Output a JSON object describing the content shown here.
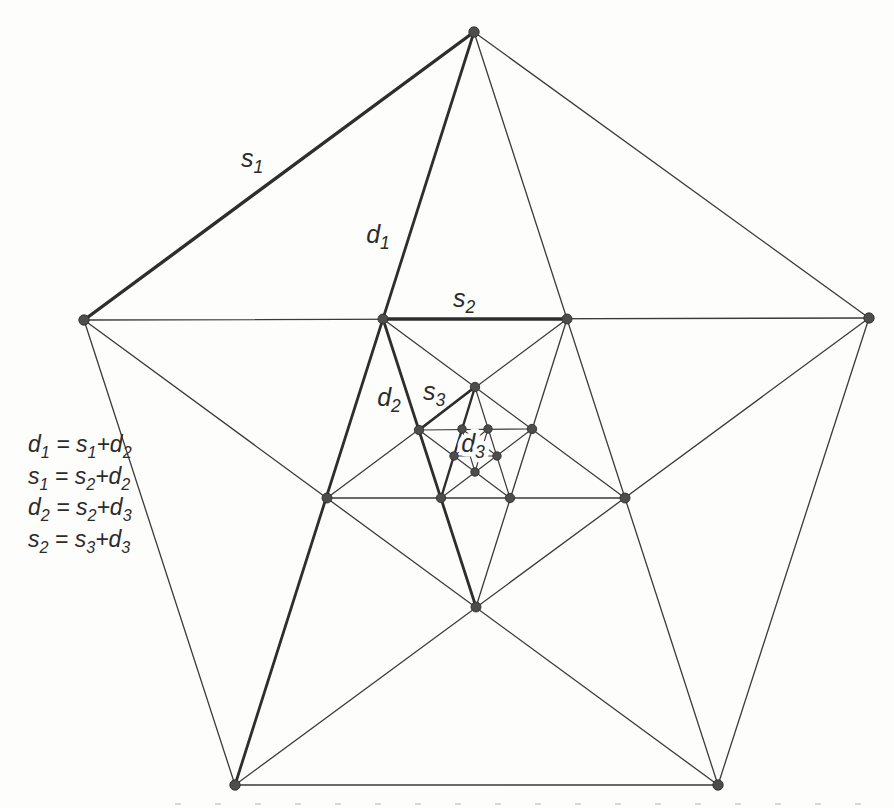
{
  "figure": {
    "width": 894,
    "height": 808,
    "background": "#fdfdfc",
    "line_color": "#3a3a3a",
    "thick_color": "#2e2e2e",
    "dot_fill": "#4d4d4d",
    "dot_ring": "#2f2f2f",
    "text_color": "#2b2b2b"
  },
  "diagram": {
    "label_font_size": 25,
    "lines": [
      {
        "x1": 474,
        "y1": 32,
        "x2": 869,
        "y2": 318,
        "w": 1.3,
        "name": "side-top-right"
      },
      {
        "x1": 869,
        "y1": 318,
        "x2": 718,
        "y2": 785,
        "w": 1.3,
        "name": "side-right-bottomright"
      },
      {
        "x1": 718,
        "y1": 785,
        "x2": 235,
        "y2": 785,
        "w": 1.6,
        "name": "side-bottom"
      },
      {
        "x1": 235,
        "y1": 785,
        "x2": 84,
        "y2": 320,
        "w": 1.3,
        "name": "side-bottomleft-left"
      },
      {
        "x1": 84,
        "y1": 320,
        "x2": 474,
        "y2": 32,
        "w": 3.4,
        "name": "s1",
        "thick": true
      },
      {
        "x1": 474,
        "y1": 32,
        "x2": 235,
        "y2": 785,
        "w": 2.8,
        "name": "d1",
        "thick": true
      },
      {
        "x1": 474,
        "y1": 32,
        "x2": 718,
        "y2": 785,
        "w": 1.3,
        "name": "diagonal-top-bottomright"
      },
      {
        "x1": 84,
        "y1": 320,
        "x2": 869,
        "y2": 318,
        "w": 1.3,
        "name": "diagonal-left-right"
      },
      {
        "x1": 84,
        "y1": 320,
        "x2": 718,
        "y2": 785,
        "w": 1.3,
        "name": "diagonal-left-bottomright"
      },
      {
        "x1": 869,
        "y1": 318,
        "x2": 235,
        "y2": 785,
        "w": 1.3,
        "name": "diagonal-right-bottomleft"
      },
      {
        "x1": 383,
        "y1": 319,
        "x2": 625,
        "y2": 498,
        "w": 1.3,
        "name": "l2-diagonal-e2-b2"
      },
      {
        "x1": 567,
        "y1": 319,
        "x2": 327,
        "y2": 498,
        "w": 1.3,
        "name": "l2-diagonal-a2-d2"
      },
      {
        "x1": 383,
        "y1": 319,
        "x2": 476,
        "y2": 607,
        "w": 2.8,
        "name": "d2",
        "thick": true
      },
      {
        "x1": 567,
        "y1": 319,
        "x2": 476,
        "y2": 607,
        "w": 1.3,
        "name": "l2-diagonal-a2-c2"
      },
      {
        "x1": 625,
        "y1": 498,
        "x2": 327,
        "y2": 498,
        "w": 1.3,
        "name": "l2-diagonal-b2-d2"
      },
      {
        "x1": 475,
        "y1": 387,
        "x2": 510,
        "y2": 498,
        "w": 1.2,
        "name": "l3-diagonal-a3-c3"
      },
      {
        "x1": 475,
        "y1": 387,
        "x2": 441,
        "y2": 498,
        "w": 2.4,
        "name": "d3",
        "thick": true
      },
      {
        "x1": 419,
        "y1": 430,
        "x2": 532,
        "y2": 429,
        "w": 1.2,
        "name": "l3-diagonal-e3-b3"
      },
      {
        "x1": 419,
        "y1": 430,
        "x2": 510,
        "y2": 498,
        "w": 1.2,
        "name": "l3-diagonal-e3-c3"
      },
      {
        "x1": 532,
        "y1": 429,
        "x2": 441,
        "y2": 498,
        "w": 1.2,
        "name": "l3-diagonal-b3-d3"
      },
      {
        "x1": 462,
        "y1": 429,
        "x2": 497,
        "y2": 456,
        "w": 1.1,
        "name": "l4-diagonal-1"
      },
      {
        "x1": 462,
        "y1": 429,
        "x2": 475,
        "y2": 472,
        "w": 1.1,
        "name": "l4-diagonal-2"
      },
      {
        "x1": 488,
        "y1": 429,
        "x2": 454,
        "y2": 456,
        "w": 1.1,
        "name": "l4-diagonal-3"
      },
      {
        "x1": 488,
        "y1": 429,
        "x2": 475,
        "y2": 472,
        "w": 1.1,
        "name": "l4-diagonal-4"
      },
      {
        "x1": 454,
        "y1": 456,
        "x2": 497,
        "y2": 456,
        "w": 1.1,
        "name": "l4-diagonal-5"
      },
      {
        "x1": 383,
        "y1": 319,
        "x2": 567,
        "y2": 319,
        "w": 3.4,
        "name": "s2",
        "thick": true
      },
      {
        "x1": 475,
        "y1": 387,
        "x2": 419,
        "y2": 430,
        "w": 2.8,
        "name": "s3",
        "thick": true
      }
    ],
    "dots": [
      {
        "x": 474,
        "y": 32,
        "r": 5.2,
        "name": "vertex-top"
      },
      {
        "x": 869,
        "y": 318,
        "r": 5.2,
        "name": "vertex-right"
      },
      {
        "x": 718,
        "y": 785,
        "r": 5.2,
        "name": "vertex-bottom-right"
      },
      {
        "x": 235,
        "y": 785,
        "r": 5.2,
        "name": "vertex-bottom-left"
      },
      {
        "x": 84,
        "y": 320,
        "r": 5.2,
        "name": "vertex-left"
      },
      {
        "x": 567,
        "y": 319,
        "r": 5.0,
        "name": "vertex-a2"
      },
      {
        "x": 625,
        "y": 498,
        "r": 5.0,
        "name": "vertex-b2"
      },
      {
        "x": 476,
        "y": 607,
        "r": 5.0,
        "name": "vertex-c2"
      },
      {
        "x": 327,
        "y": 498,
        "r": 5.0,
        "name": "vertex-d2"
      },
      {
        "x": 383,
        "y": 319,
        "r": 5.0,
        "name": "vertex-e2"
      },
      {
        "x": 475,
        "y": 387,
        "r": 4.7,
        "name": "vertex-a3"
      },
      {
        "x": 532,
        "y": 429,
        "r": 4.7,
        "name": "vertex-b3"
      },
      {
        "x": 510,
        "y": 498,
        "r": 4.7,
        "name": "vertex-c3"
      },
      {
        "x": 441,
        "y": 498,
        "r": 4.7,
        "name": "vertex-d3"
      },
      {
        "x": 419,
        "y": 430,
        "r": 4.7,
        "name": "vertex-e3"
      },
      {
        "x": 488,
        "y": 429,
        "r": 4.2,
        "name": "vertex-l4-upper-right"
      },
      {
        "x": 497,
        "y": 456,
        "r": 4.2,
        "name": "vertex-l4-right"
      },
      {
        "x": 475,
        "y": 472,
        "r": 4.2,
        "name": "vertex-l4-bottom"
      },
      {
        "x": 454,
        "y": 456,
        "r": 4.2,
        "name": "vertex-l4-left"
      },
      {
        "x": 462,
        "y": 429,
        "r": 4.2,
        "name": "vertex-l4-upper-left"
      }
    ],
    "labels": [
      {
        "text": "s_1",
        "x": 252,
        "y": 167,
        "halo": false
      },
      {
        "text": "d_1",
        "x": 378,
        "y": 243,
        "halo": false
      },
      {
        "text": "s_2",
        "x": 464,
        "y": 307,
        "halo": false
      },
      {
        "text": "d_2",
        "x": 389,
        "y": 406,
        "halo": false
      },
      {
        "text": "s_3",
        "x": 434,
        "y": 400,
        "halo": false
      },
      {
        "text": "d_3",
        "x": 473,
        "y": 452,
        "halo": true
      }
    ],
    "equations": {
      "x": 28,
      "font_size": 23,
      "lines": [
        {
          "text": "d_1 = s_1+d_2",
          "y": 452
        },
        {
          "text": "s_1 = s_2+d_2",
          "y": 484
        },
        {
          "text": "d_2 = s_2+d_3",
          "y": 515
        },
        {
          "text": "s_2 = s_3+d_3",
          "y": 547
        }
      ]
    },
    "caption_remnant": {
      "x1": 175,
      "x2": 894,
      "y": 804,
      "color": "#bfbdba",
      "dash": "6 34",
      "w": 2.2,
      "opacity": 0.6
    }
  }
}
